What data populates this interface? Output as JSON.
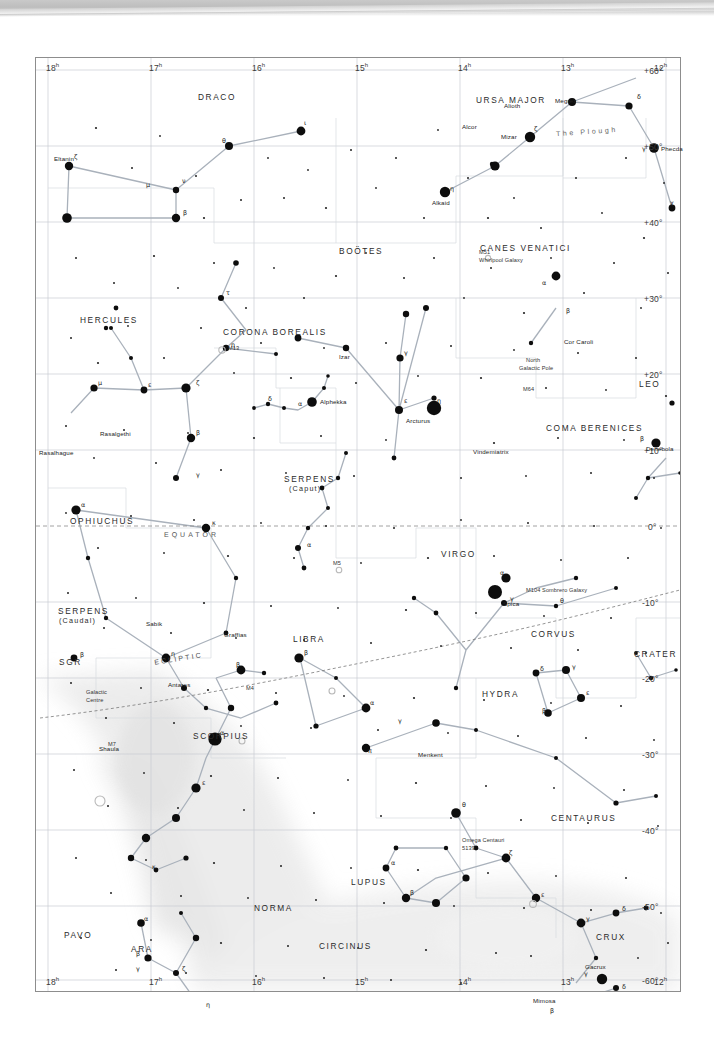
{
  "chart": {
    "ra_axis": {
      "label": "Right Ascension",
      "ticks": [
        "18",
        "17",
        "16",
        "15",
        "14",
        "13",
        "12"
      ],
      "unit": "h"
    },
    "dec_axis": {
      "label": "Declination",
      "ticks": [
        "+60°",
        "+50°",
        "+40°",
        "+30°",
        "+20°",
        "+10°",
        "0°",
        "-10°",
        "-20°",
        "-30°",
        "-40°",
        "-50°",
        "-60°"
      ]
    },
    "lines": {
      "equator_label": "EQUATOR",
      "ecliptic_label": "ECLIPTIC",
      "plough_label": "The Plough"
    },
    "colors": {
      "star": "#111111",
      "grid": "#c3c8cf",
      "constellation_line": "#a8b0ba",
      "border": "#8d8d8d",
      "milky_way": "#ededed",
      "text": "#222222"
    },
    "constellations": [
      {
        "name": "DRACO",
        "x": 197,
        "y": 92
      },
      {
        "name": "URSA MAJOR",
        "x": 475,
        "y": 95
      },
      {
        "name": "CANES VENATICI",
        "x": 479,
        "y": 243
      },
      {
        "name": "BOÖTES",
        "x": 338,
        "y": 246
      },
      {
        "name": "HERCULES",
        "x": 79,
        "y": 315
      },
      {
        "name": "CORONA BOREALIS",
        "x": 222,
        "y": 327
      },
      {
        "name": "LEO",
        "x": 638,
        "y": 379
      },
      {
        "name": "COMA BERENICES",
        "x": 545,
        "y": 423
      },
      {
        "name": "SERPENS",
        "x": 283,
        "y": 474
      },
      {
        "name": "(Caput)",
        "x": 288,
        "y": 484
      },
      {
        "name": "OPHIUCHUS",
        "x": 69,
        "y": 516
      },
      {
        "name": "VIRGO",
        "x": 440,
        "y": 549
      },
      {
        "name": "SERPENS",
        "x": 57,
        "y": 606
      },
      {
        "name": "(Caudal)",
        "x": 58,
        "y": 616
      },
      {
        "name": "SGR",
        "x": 58,
        "y": 657
      },
      {
        "name": "LIBRA",
        "x": 292,
        "y": 634
      },
      {
        "name": "CORVUS",
        "x": 530,
        "y": 629
      },
      {
        "name": "CRATER",
        "x": 633,
        "y": 649
      },
      {
        "name": "HYDRA",
        "x": 481,
        "y": 689
      },
      {
        "name": "SCORPIUS",
        "x": 192,
        "y": 731
      },
      {
        "name": "CENTAURUS",
        "x": 550,
        "y": 813
      },
      {
        "name": "LUPUS",
        "x": 350,
        "y": 877
      },
      {
        "name": "NORMA",
        "x": 253,
        "y": 903
      },
      {
        "name": "CIRCINUS",
        "x": 318,
        "y": 941
      },
      {
        "name": "ARA",
        "x": 130,
        "y": 944
      },
      {
        "name": "PAVO",
        "x": 63,
        "y": 930
      },
      {
        "name": "CRUX",
        "x": 595,
        "y": 932
      }
    ],
    "named_stars": [
      {
        "name": "Eltanin",
        "x": 57,
        "y": 157
      },
      {
        "name": "Alioth",
        "x": 528,
        "y": 108
      },
      {
        "name": "Megrez",
        "x": 571,
        "y": 100
      },
      {
        "name": "Alcor",
        "x": 484,
        "y": 124
      },
      {
        "name": "Mizar",
        "x": 495,
        "y": 133
      },
      {
        "name": "Phecda",
        "x": 622,
        "y": 146
      },
      {
        "name": "Alkaid",
        "x": 444,
        "y": 190
      },
      {
        "name": "Cor Caroli",
        "x": 545,
        "y": 276
      },
      {
        "name": "Alphekka",
        "x": 281,
        "y": 360
      },
      {
        "name": "Izar",
        "x": 346,
        "y": 355
      },
      {
        "name": "Arcturus",
        "x": 398,
        "y": 408
      },
      {
        "name": "Rasalgethi",
        "x": 105,
        "y": 433
      },
      {
        "name": "Rasalhague",
        "x": 58,
        "y": 452
      },
      {
        "name": "Denebola",
        "x": 641,
        "y": 444
      },
      {
        "name": "Vindemiatrix",
        "x": 480,
        "y": 450
      },
      {
        "name": "Spica",
        "x": 489,
        "y": 592
      },
      {
        "name": "Sabik",
        "x": 144,
        "y": 622
      },
      {
        "name": "Graffias",
        "x": 224,
        "y": 634
      },
      {
        "name": "Antares",
        "x": 175,
        "y": 682
      },
      {
        "name": "Menkent",
        "x": 419,
        "y": 751
      },
      {
        "name": "Shaula",
        "x": 100,
        "y": 753
      },
      {
        "name": "Gacrux",
        "x": 566,
        "y": 928
      },
      {
        "name": "Mimosa",
        "x": 532,
        "y": 957
      }
    ],
    "deep_sky": [
      {
        "label": "M51",
        "x": 485,
        "y": 199
      },
      {
        "label": "Whirlpool Galaxy",
        "x": 485,
        "y": 207
      },
      {
        "label": "M13",
        "x": 190,
        "y": 293
      },
      {
        "label": "M5",
        "x": 303,
        "y": 509
      },
      {
        "label": "North",
        "x": 532,
        "y": 363
      },
      {
        "label": "Galactic Pole",
        "x": 527,
        "y": 370
      },
      {
        "label": "M64",
        "x": 527,
        "y": 388
      },
      {
        "label": "M104  Sombrero Galaxy",
        "x": 534,
        "y": 588
      },
      {
        "label": "M4",
        "x": 215,
        "y": 688
      },
      {
        "label": "M7",
        "x": 79,
        "y": 744
      },
      {
        "label": "Omega Centauri",
        "x": 462,
        "y": 838
      },
      {
        "label": "5139",
        "x": 462,
        "y": 845
      },
      {
        "label": "Galactic",
        "x": 88,
        "y": 691
      },
      {
        "label": "Centre",
        "x": 88,
        "y": 698
      }
    ]
  }
}
